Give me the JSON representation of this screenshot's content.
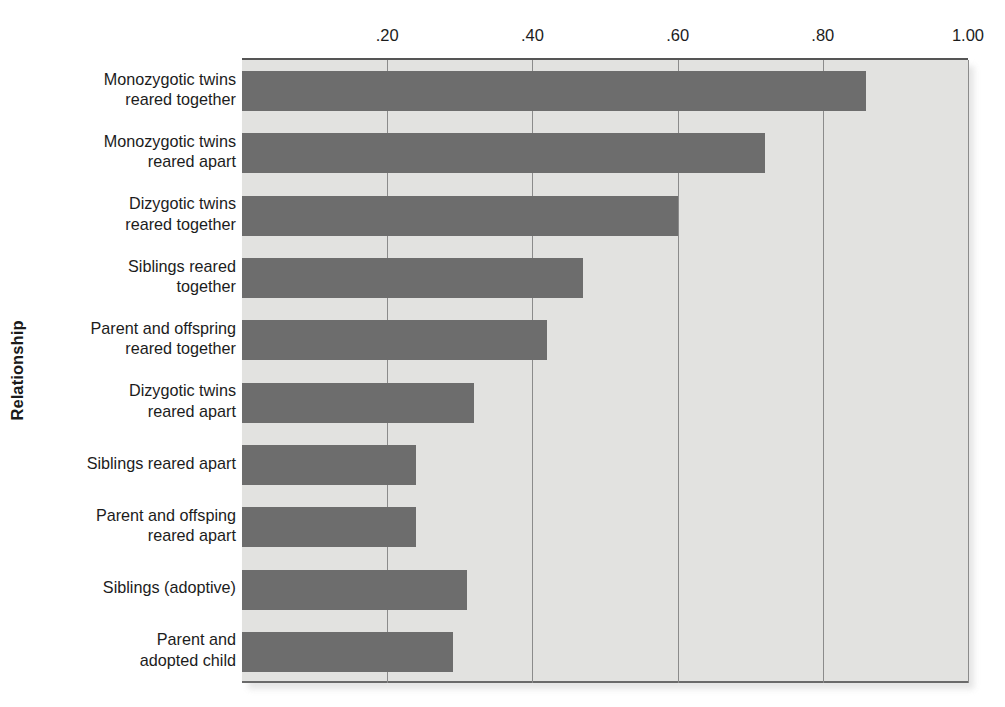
{
  "chart_data": {
    "type": "bar",
    "orientation": "horizontal",
    "title": "",
    "xlabel": "",
    "ylabel": "Relationship",
    "xlim": [
      0,
      1.0
    ],
    "xticks": [
      0.2,
      0.4,
      0.6,
      0.8,
      1.0
    ],
    "xtick_labels": [
      ".20",
      ".40",
      ".60",
      ".80",
      "1.00"
    ],
    "grid": "vertical",
    "legend": "none",
    "bar_color": "#6d6d6d",
    "plot_background": "#e2e2e0",
    "categories": [
      "Monozygotic twins\nreared together",
      "Monozygotic twins\nreared apart",
      "Dizygotic twins\nreared together",
      "Siblings reared\ntogether",
      "Parent and offspring\nreared together",
      "Dizygotic twins\nreared apart",
      "Siblings reared apart",
      "Parent and offsping\nreared apart",
      "Siblings (adoptive)",
      "Parent and\nadopted child"
    ],
    "values": [
      0.86,
      0.72,
      0.6,
      0.47,
      0.42,
      0.32,
      0.24,
      0.24,
      0.31,
      0.29
    ]
  }
}
